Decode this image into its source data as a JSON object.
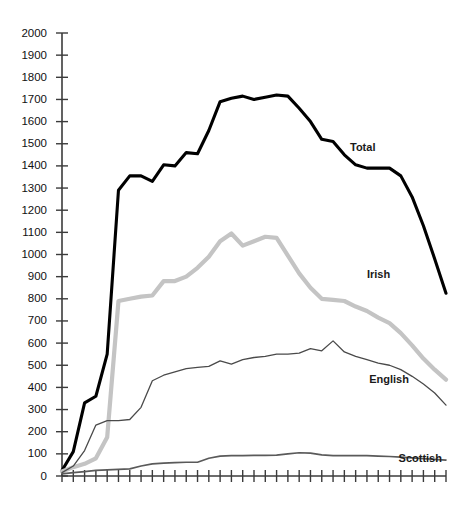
{
  "chart_data": {
    "type": "line",
    "title": "",
    "subtitle": "",
    "xlabel": "",
    "ylabel": "",
    "ylim": [
      0,
      2000
    ],
    "ytick_step": 100,
    "yticks": [
      0,
      100,
      200,
      300,
      400,
      500,
      600,
      700,
      800,
      900,
      1000,
      1100,
      1200,
      1300,
      1400,
      1500,
      1600,
      1700,
      1800,
      1900,
      2000
    ],
    "ytick_labels": [
      "0",
      "100",
      "200",
      "300",
      "400",
      "500",
      "600",
      "700",
      "800",
      "900",
      "1000",
      "1100",
      "1200",
      "1300",
      "1400",
      "1500",
      "1600",
      "1700",
      "1800",
      "1900",
      "2000"
    ],
    "x_tick_count": 35,
    "x_tick_labels": [],
    "grid": false,
    "legend_position": "inline-right",
    "x": [
      0,
      1,
      2,
      3,
      4,
      5,
      6,
      7,
      8,
      9,
      10,
      11,
      12,
      13,
      14,
      15,
      16,
      17,
      18,
      19,
      20,
      21,
      22,
      23,
      24,
      25,
      26,
      27,
      28,
      29,
      30,
      31,
      32,
      33,
      34
    ],
    "series": [
      {
        "name": "Total",
        "color": "#000000",
        "stroke_width": 3.1,
        "label": "Total",
        "label_x": 25.5,
        "label_y": 1480,
        "values": [
          25,
          110,
          330,
          360,
          550,
          1290,
          1355,
          1355,
          1330,
          1405,
          1400,
          1460,
          1455,
          1560,
          1690,
          1705,
          1715,
          1700,
          1710,
          1720,
          1715,
          1660,
          1600,
          1520,
          1510,
          1450,
          1405,
          1390,
          1390,
          1390,
          1355,
          1260,
          1130,
          980,
          825
        ]
      },
      {
        "name": "Irish",
        "color": "#c4c4c4",
        "stroke_width": 4.2,
        "label": "Irish",
        "label_x": 27.0,
        "label_y": 905,
        "values": [
          20,
          40,
          55,
          80,
          175,
          790,
          800,
          810,
          815,
          880,
          880,
          900,
          940,
          990,
          1060,
          1095,
          1040,
          1060,
          1080,
          1075,
          995,
          915,
          850,
          800,
          795,
          790,
          765,
          745,
          715,
          690,
          645,
          590,
          530,
          480,
          435
        ]
      },
      {
        "name": "English",
        "color": "#4a4a4a",
        "stroke_width": 1.3,
        "label": "English",
        "label_x": 27.2,
        "label_y": 435,
        "values": [
          15,
          45,
          115,
          230,
          250,
          250,
          255,
          310,
          430,
          455,
          470,
          485,
          490,
          495,
          520,
          505,
          525,
          535,
          540,
          550,
          550,
          555,
          575,
          565,
          610,
          560,
          540,
          525,
          510,
          500,
          480,
          450,
          415,
          375,
          320
        ]
      },
      {
        "name": "Scottish",
        "color": "#5a5a5a",
        "stroke_width": 1.7,
        "label": "Scottish",
        "label_x": 29.8,
        "label_y": 75,
        "values": [
          10,
          15,
          20,
          25,
          28,
          30,
          32,
          45,
          55,
          58,
          60,
          62,
          62,
          80,
          90,
          92,
          92,
          93,
          93,
          94,
          100,
          105,
          103,
          95,
          92,
          92,
          92,
          92,
          90,
          88,
          85,
          82,
          78,
          75,
          72
        ]
      }
    ]
  },
  "geometry": {
    "plot_left": 62,
    "plot_right": 446,
    "plot_top": 33,
    "plot_bottom": 476,
    "tick_len": 6,
    "ylabel_gap": 9
  }
}
